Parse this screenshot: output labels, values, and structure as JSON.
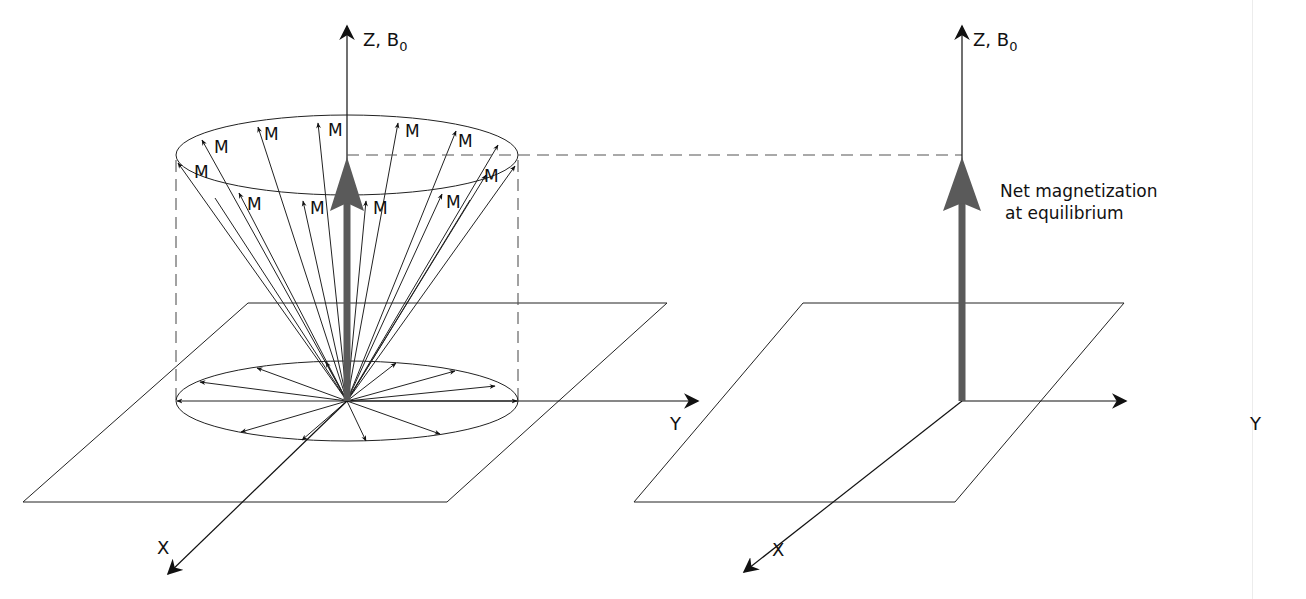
{
  "diagram": {
    "type": "MRI net magnetization diagram",
    "panels": [
      {
        "id": "left",
        "description": "Precessing spin magnetic moments on a cone around Z, B0",
        "z_label": "Z, B",
        "z_label_sub": "0",
        "y_label": "Y",
        "x_label": "X",
        "moment_label": "M",
        "moment_count": 15
      },
      {
        "id": "right",
        "description": "Net magnetization vector along Z",
        "z_label": "Z, B",
        "z_label_sub": "0",
        "y_label": "Y",
        "x_label": "X",
        "annotation_line1": "Net magnetization",
        "annotation_line2": "at equilibrium"
      }
    ],
    "colors": {
      "line": "#111111",
      "net_vector": "#5a5a5a",
      "dashed": "#555555"
    }
  }
}
